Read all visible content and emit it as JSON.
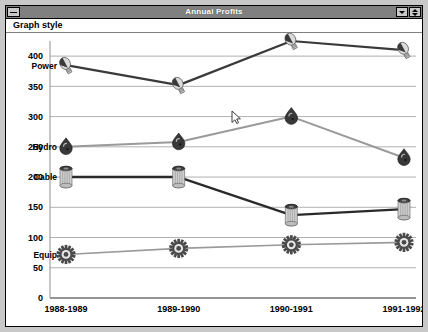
{
  "window": {
    "title": "Annual Profits",
    "system_menu_icon": "window-menu-icon",
    "minimize_icon": "minimize-icon",
    "maximize_icon": "maximize-restore-icon"
  },
  "menubar": {
    "items": [
      {
        "label": "Graph style",
        "name": "menu-graph-style"
      }
    ]
  },
  "chart_data": {
    "type": "line",
    "title": "Annual Profits",
    "xlabel": "",
    "ylabel": "",
    "categories": [
      "1988-1989",
      "1989-1990",
      "1990-1991",
      "1991-1992"
    ],
    "ylim": [
      0,
      425
    ],
    "yticks": [
      0,
      50,
      100,
      150,
      200,
      250,
      300,
      350,
      400
    ],
    "ytick_labels": [
      "0",
      "50",
      "100",
      "150",
      "200",
      "250",
      "300",
      "350",
      "400"
    ],
    "grid": true,
    "legend": "inline-labels",
    "series": [
      {
        "name": "Power",
        "marker": "lightbulb-marker",
        "color": "#3a3a3a",
        "line_width": 2.2,
        "values": [
          385,
          352,
          425,
          410
        ]
      },
      {
        "name": "Hydro",
        "marker": "water-drop-marker",
        "color": "#9a9a9a",
        "line_width": 2.0,
        "values": [
          250,
          258,
          300,
          232
        ]
      },
      {
        "name": "Cable",
        "marker": "cable-spool-marker",
        "color": "#2a2a2a",
        "line_width": 2.4,
        "values": [
          200,
          200,
          137,
          147
        ]
      },
      {
        "name": "Equip",
        "marker": "gear-marker",
        "color": "#9a9a9a",
        "line_width": 1.6,
        "values": [
          72,
          82,
          88,
          92
        ]
      }
    ]
  },
  "cursor": {
    "name": "mouse-pointer",
    "x": 232,
    "y": 110
  },
  "colors": {
    "desktop": "#c8c8c8",
    "titlebar": "#808080",
    "titlebar_text": "#ffffff",
    "plot_background": "#ffffff",
    "gridline": "#b0b0b0"
  }
}
